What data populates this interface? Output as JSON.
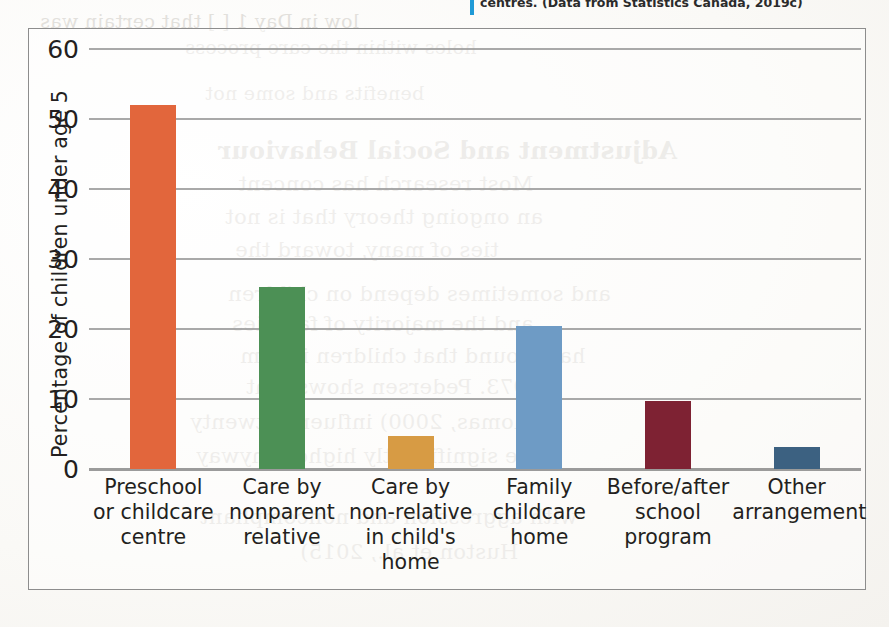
{
  "caption": {
    "text": "centres.  (Data from Statistics Canada, 2019c)",
    "rule_color": "#1f9ad6"
  },
  "ghost_text": [
    {
      "text": "low in Day 1 [ ] that certain was",
      "x": 40,
      "y": 10,
      "size": 19,
      "heading": false
    },
    {
      "text": "holes within the care process",
      "x": 185,
      "y": 36,
      "size": 19,
      "heading": false
    },
    {
      "text": "benefits and some not",
      "x": 205,
      "y": 82,
      "size": 19,
      "heading": false
    },
    {
      "text": "Adjustment and Social Behaviour",
      "x": 218,
      "y": 136,
      "size": 24,
      "heading": true
    },
    {
      "text": "Most research has concent",
      "x": 238,
      "y": 172,
      "size": 21,
      "heading": false
    },
    {
      "text": "an ongoing theory that is not",
      "x": 225,
      "y": 205,
      "size": 21,
      "heading": false
    },
    {
      "text": "ties of many, toward the",
      "x": 235,
      "y": 238,
      "size": 21,
      "heading": false
    },
    {
      "text": "and sometimes depend on children",
      "x": 228,
      "y": 282,
      "size": 21,
      "heading": false
    },
    {
      "text": "and the majority of families",
      "x": 232,
      "y": 312,
      "size": 21,
      "heading": false
    },
    {
      "text": "have found that children in fam",
      "x": 240,
      "y": 344,
      "size": 21,
      "heading": false
    },
    {
      "text": "1973. Pedersen shows that",
      "x": 246,
      "y": 375,
      "size": 21,
      "heading": false
    },
    {
      "text": "Thomas, 2000) influence twenty",
      "x": 190,
      "y": 410,
      "size": 21,
      "heading": false
    },
    {
      "text": "were significantly higher anyway",
      "x": 196,
      "y": 444,
      "size": 21,
      "heading": false
    },
    {
      "text": "with aggression and noncompliant",
      "x": 200,
      "y": 505,
      "size": 21,
      "heading": false
    },
    {
      "text": "Huston et al., 2015)",
      "x": 300,
      "y": 540,
      "size": 21,
      "heading": false
    }
  ],
  "chart_data": {
    "type": "bar",
    "title": "",
    "xlabel": "",
    "ylabel": "Percentage of children under age 5",
    "ylim": [
      0,
      60
    ],
    "yticks": [
      0,
      10,
      20,
      30,
      40,
      50,
      60
    ],
    "grid": true,
    "legend": "none",
    "categories": [
      "Preschool or childcare centre",
      "Care by nonparent relative",
      "Care by non-relative in child's home",
      "Family childcare home",
      "Before/after school program",
      "Other arrangement"
    ],
    "category_lines": [
      [
        "Preschool",
        "or childcare",
        "centre"
      ],
      [
        "Care by",
        "nonparent",
        "relative"
      ],
      [
        "Care by",
        "non-relative",
        "in child's",
        "home"
      ],
      [
        "Family",
        "childcare",
        "home"
      ],
      [
        "Before/after",
        "school",
        "program"
      ],
      [
        "Other",
        "arrangement"
      ]
    ],
    "values": [
      52.0,
      26.0,
      4.7,
      20.4,
      9.7,
      3.1
    ],
    "colors": [
      "#E2663C",
      "#4C9055",
      "#D79B44",
      "#6E9BC5",
      "#7E2233",
      "#3C6181"
    ]
  }
}
